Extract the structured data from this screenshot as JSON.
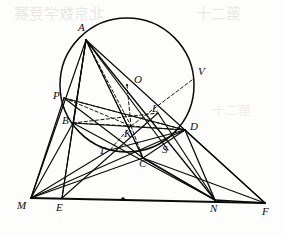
{
  "figure": {
    "kind": "euclidean-geometry-diagram",
    "caption": "",
    "stroke_color": "#0a0a0a",
    "background_color": "#fdfdfb",
    "width": 284,
    "height": 235
  },
  "circle": {
    "name": "circumscribed-circle",
    "center_label": "O",
    "cx": 127,
    "cy": 85,
    "r": 67,
    "style": "solid"
  },
  "points": [
    {
      "id": "A",
      "label": "A",
      "x": 86,
      "y": 40,
      "lx": 78,
      "ly": 22,
      "on_circle": true
    },
    {
      "id": "O",
      "label": "O",
      "x": 127,
      "y": 85,
      "lx": 134,
      "ly": 74,
      "on_circle": false
    },
    {
      "id": "V",
      "label": "V",
      "x": 192,
      "y": 80,
      "lx": 198,
      "ly": 66,
      "on_circle": true
    },
    {
      "id": "P",
      "label": "P",
      "x": 64,
      "y": 98,
      "lx": 53,
      "ly": 90,
      "on_circle": false
    },
    {
      "id": "B",
      "label": "B",
      "x": 73,
      "y": 123,
      "lx": 62,
      "ly": 115,
      "on_circle": true
    },
    {
      "id": "L",
      "label": "L",
      "x": 158,
      "y": 113,
      "lx": 152,
      "ly": 103,
      "on_circle": false
    },
    {
      "id": "D",
      "label": "D",
      "x": 185,
      "y": 130,
      "lx": 190,
      "ly": 121,
      "on_circle": true
    },
    {
      "id": "K",
      "label": "K",
      "x": 131,
      "y": 126,
      "lx": 124,
      "ly": 128,
      "on_circle": false
    },
    {
      "id": "T",
      "label": "T",
      "x": 110,
      "y": 150,
      "lx": 99,
      "ly": 145,
      "on_circle": false
    },
    {
      "id": "S",
      "label": "S",
      "x": 168,
      "y": 150,
      "lx": 162,
      "ly": 144,
      "on_circle": false
    },
    {
      "id": "C",
      "label": "C",
      "x": 143,
      "y": 158,
      "lx": 139,
      "ly": 158,
      "on_circle": true
    },
    {
      "id": "M",
      "label": "M",
      "x": 31,
      "y": 198,
      "lx": 17,
      "ly": 200,
      "on_circle": false
    },
    {
      "id": "E",
      "label": "E",
      "x": 62,
      "y": 198,
      "lx": 56,
      "ly": 202,
      "on_circle": false
    },
    {
      "id": "N",
      "label": "N",
      "x": 215,
      "y": 200,
      "lx": 210,
      "ly": 203,
      "on_circle": false
    },
    {
      "id": "F",
      "label": "F",
      "x": 265,
      "y": 203,
      "lx": 262,
      "ly": 206,
      "on_circle": false
    }
  ],
  "midpoint_mark": {
    "name": "segment-midpoint-dot",
    "x": 123,
    "y": 199
  },
  "solid_segments": [
    {
      "from": "M",
      "to": "F",
      "weight": 1.9
    },
    {
      "from": "M",
      "to": "A",
      "weight": 1.2
    },
    {
      "from": "M",
      "to": "P",
      "weight": 1.2
    },
    {
      "from": "M",
      "to": "B",
      "weight": 1.2
    },
    {
      "from": "M",
      "to": "T",
      "weight": 1.1
    },
    {
      "from": "M",
      "to": "C",
      "weight": 1.2
    },
    {
      "from": "M",
      "to": "D",
      "weight": 1.1
    },
    {
      "from": "A",
      "to": "E",
      "weight": 1.2
    },
    {
      "from": "A",
      "to": "N",
      "weight": 1.3
    },
    {
      "from": "A",
      "to": "C",
      "weight": 1.3
    },
    {
      "from": "A",
      "to": "S",
      "weight": 1.2
    },
    {
      "from": "A",
      "to": "F",
      "weight": 1.2
    },
    {
      "from": "A",
      "to": "B",
      "weight": 1.2
    },
    {
      "from": "P",
      "to": "C",
      "weight": 1.2
    },
    {
      "from": "P",
      "to": "D",
      "weight": 1.1
    },
    {
      "from": "B",
      "to": "N",
      "weight": 1.2
    },
    {
      "from": "B",
      "to": "D",
      "weight": 1.1
    },
    {
      "from": "E",
      "to": "L",
      "weight": 1.1
    },
    {
      "from": "C",
      "to": "N",
      "weight": 1.6
    },
    {
      "from": "C",
      "to": "F",
      "weight": 1.2
    },
    {
      "from": "C",
      "to": "D",
      "weight": 1.2
    },
    {
      "from": "T",
      "to": "D",
      "weight": 1.1
    },
    {
      "from": "N",
      "to": "F",
      "weight": 1.6
    },
    {
      "from": "N",
      "to": "D",
      "weight": 1.3
    },
    {
      "from": "N",
      "to": "L",
      "weight": 1.2
    },
    {
      "from": "D",
      "to": "F",
      "weight": 1.2
    },
    {
      "from": "E",
      "to": "A",
      "weight": 1.1
    }
  ],
  "dashed_segments": [
    {
      "from": "A",
      "to": "K"
    },
    {
      "from": "A",
      "to": "C"
    },
    {
      "from": "V",
      "to": "K"
    },
    {
      "from": "P",
      "to": "K"
    },
    {
      "from": "P",
      "to": "D"
    },
    {
      "from": "B",
      "to": "K"
    },
    {
      "from": "B",
      "to": "L"
    },
    {
      "from": "K",
      "to": "C"
    },
    {
      "from": "K",
      "to": "D"
    },
    {
      "from": "K",
      "to": "T"
    },
    {
      "from": "O",
      "to": "K"
    },
    {
      "from": "C",
      "to": "N"
    }
  ],
  "bleed_through": {
    "top_text": "北京数学竞赛",
    "right_text": "第二十"
  }
}
